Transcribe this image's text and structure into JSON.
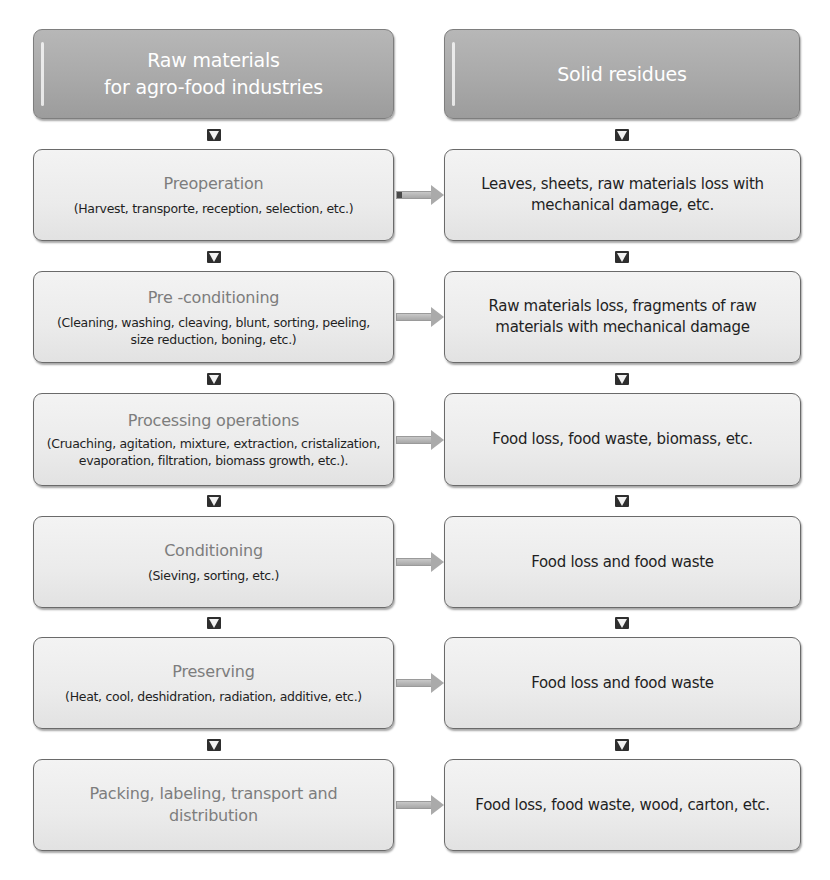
{
  "diagram": {
    "left_column": {
      "header": {
        "line1": "Raw materials",
        "line2": "for agro-food industries"
      },
      "steps": [
        {
          "title": "Preoperation",
          "description": "(Harvest, transporte, reception, selection, etc.)"
        },
        {
          "title": "Pre -conditioning",
          "description": "(Cleaning, washing, cleaving, blunt, sorting, peeling, size reduction, boning, etc.)"
        },
        {
          "title": "Processing operations",
          "description": "(Cruaching, agitation, mixture, extraction, cristalization, evaporation, filtration, biomass growth, etc.)."
        },
        {
          "title": "Conditioning",
          "description": "(Sieving, sorting, etc.)"
        },
        {
          "title": "Preserving",
          "description": "(Heat, cool, deshidration, radiation, additive, etc.)"
        },
        {
          "title": "Packing, labeling, transport and distribution",
          "description": ""
        }
      ]
    },
    "right_column": {
      "header": {
        "line1": "Solid residues"
      },
      "residues": [
        "Leaves, sheets, raw materials loss with mechanical damage, etc.",
        "Raw materials loss, fragments of raw materials with mechanical damage",
        "Food loss, food waste, biomass, etc.",
        "Food loss and food waste",
        "Food loss and food waste",
        "Food loss, food waste, wood, carton, etc."
      ]
    },
    "icons": {
      "down_arrow": "down-arrow-icon",
      "right_arrow": "right-arrow-icon"
    },
    "colors": {
      "header_fill": "#a9a9a9",
      "step_fill": "#ececec",
      "border": "#6a6a6a",
      "title_text": "#7d7d7d",
      "body_text": "#1f1f1f",
      "header_text": "#ffffff",
      "connector_arrow": "#aaaaaa"
    }
  }
}
